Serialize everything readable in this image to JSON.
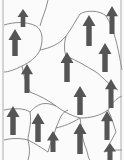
{
  "diagram": {
    "type": "domain-grid",
    "colors": {
      "background": "#fbfbfb",
      "boundary": "#6e6e6e",
      "arrow": "#555555",
      "frame": "#9a9a9a"
    },
    "arrow_direction": "up",
    "arrows": [
      {
        "x": 23,
        "y1": 27,
        "y2": 9,
        "w": 11
      },
      {
        "x": 15,
        "y1": 56,
        "y2": 29,
        "w": 13
      },
      {
        "x": 89,
        "y1": 46,
        "y2": 15,
        "w": 13
      },
      {
        "x": 112,
        "y1": 34,
        "y2": 6,
        "w": 12
      },
      {
        "x": 105,
        "y1": 72,
        "y2": 43,
        "w": 13
      },
      {
        "x": 67,
        "y1": 82,
        "y2": 52,
        "w": 13
      },
      {
        "x": 27,
        "y1": 93,
        "y2": 64,
        "w": 12
      },
      {
        "x": 13,
        "y1": 135,
        "y2": 106,
        "w": 13
      },
      {
        "x": 38,
        "y1": 142,
        "y2": 113,
        "w": 13
      },
      {
        "x": 53,
        "y1": 152,
        "y2": 131,
        "w": 12
      },
      {
        "x": 80,
        "y1": 115,
        "y2": 86,
        "w": 13
      },
      {
        "x": 111,
        "y1": 108,
        "y2": 79,
        "w": 12
      },
      {
        "x": 80,
        "y1": 154,
        "y2": 123,
        "w": 13
      },
      {
        "x": 107,
        "y1": 140,
        "y2": 111,
        "w": 12
      },
      {
        "x": 110,
        "y1": 162,
        "y2": 143,
        "w": 12
      }
    ],
    "boundaries": [
      "M4,25 C14,22 26,21 36,26 C42,30 44,38 40,50 C36,58 30,62 22,66 C14,70 8,72 4,72",
      "M48,0 C46,10 42,18 40,26",
      "M40,50 C50,48 60,44 66,36 C72,28 76,20 80,14 C86,10 100,10 106,16 C110,22 112,28 114,34",
      "M66,36 C64,44 64,50 66,56",
      "M22,66 C24,76 26,84 30,92",
      "M30,92 C40,96 48,100 56,106",
      "M4,110 C14,108 24,108 30,112 C36,106 42,100 56,106",
      "M56,106 C64,112 72,116 80,118 C90,118 100,116 108,110 C112,104 116,98 122,96",
      "M114,34 C118,46 120,60 122,70",
      "M66,56 C76,60 86,66 96,72 C104,78 110,86 118,90",
      "M4,140 C12,138 20,138 28,140 C36,144 42,148 48,152",
      "M30,112 C32,124 28,134 28,140",
      "M48,152 C50,144 54,136 56,128 C60,118 62,112 68,110",
      "M80,118 C82,130 82,140 86,148 C88,154 88,158 90,160",
      "M108,110 C112,118 114,126 116,132 C112,140 108,146 104,152",
      "M56,128 C64,126 70,124 80,118",
      "M28,140 C30,148 30,154 28,160",
      "M104,152 C110,150 116,150 122,150"
    ],
    "frame": {
      "left_x": 3,
      "right_x": 121
    }
  }
}
